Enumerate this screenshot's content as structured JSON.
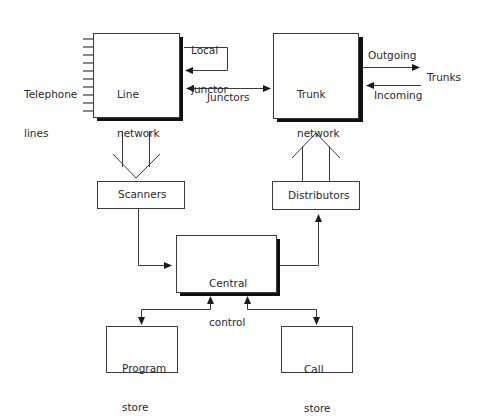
{
  "diagram": {
    "nodes": {
      "line_network": {
        "label_line1": "Line",
        "label_line2": "network"
      },
      "trunk_network": {
        "label_line1": "Trunk",
        "label_line2": "network"
      },
      "scanners": {
        "label": "Scanners"
      },
      "distributors": {
        "label": "Distributors"
      },
      "central_control": {
        "label_line1": "Central",
        "label_line2": "control"
      },
      "program_store": {
        "label_line1": "Program",
        "label_line2": "store"
      },
      "call_store": {
        "label_line1": "Call",
        "label_line2": "store"
      }
    },
    "labels": {
      "telephone_lines_1": "Telephone",
      "telephone_lines_2": "lines",
      "local_junctor_1": "Local",
      "local_junctor_2": "junctor",
      "junctors": "Junctors",
      "outgoing": "Outgoing",
      "incoming": "Incoming",
      "trunks": "Trunks"
    },
    "colors": {
      "stroke": "#3a3a3a",
      "shadow": "#111111",
      "text": "#2a2a2a",
      "background": "#ffffff"
    }
  }
}
